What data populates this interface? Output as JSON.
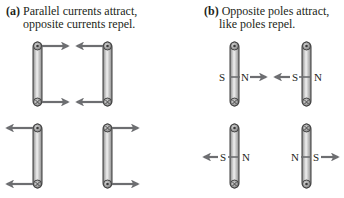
{
  "panel_a": {
    "tag": "(a)",
    "caption_line1": "Parallel currents attract,",
    "caption_line2": "opposite currents repel.",
    "loops": [
      {
        "position": "top-left",
        "top_symbol": "dot",
        "bottom_symbol": "cross",
        "force": "right"
      },
      {
        "position": "top-right",
        "top_symbol": "dot",
        "bottom_symbol": "cross",
        "force": "left"
      },
      {
        "position": "bottom-left",
        "top_symbol": "dot",
        "bottom_symbol": "cross",
        "force": "left"
      },
      {
        "position": "bottom-right",
        "top_symbol": "cross",
        "bottom_symbol": "dot",
        "force": "right"
      }
    ]
  },
  "panel_b": {
    "tag": "(b)",
    "caption_line1": "Opposite poles attract,",
    "caption_line2": "like poles repel.",
    "poles": {
      "top_left": {
        "left": "S",
        "right": "N"
      },
      "top_right": {
        "left": "S",
        "right": "N"
      },
      "bottom_left": {
        "left": "S",
        "right": "N"
      },
      "bottom_right": {
        "left": "N",
        "right": "S"
      }
    }
  },
  "colors": {
    "bar_light": "#e6e6e6",
    "bar_dark": "#8a8a8a",
    "outline": "#3a3a3a",
    "arrow": "#6d6e71",
    "text": "#231f20"
  }
}
